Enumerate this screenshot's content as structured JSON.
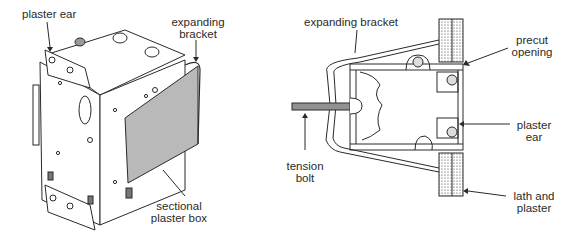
{
  "diagrams": [
    {
      "id": "left",
      "description": "Sectional plaster box with expanding bracket, perspective view",
      "labels": {
        "plaster_ear": "plaster ear",
        "expanding_bracket_1": "expanding",
        "expanding_bracket_2": "bracket",
        "sectional_box_1": "sectional",
        "sectional_box_2": "plaster box"
      }
    },
    {
      "id": "right",
      "description": "Cross-section showing box installed in precut opening of lath and plaster wall",
      "labels": {
        "expanding_bracket": "expanding bracket",
        "precut_1": "precut",
        "precut_2": "opening",
        "plaster_ear_1": "plaster",
        "plaster_ear_2": "ear",
        "tension_1": "tension",
        "tension_2": "bolt",
        "lath_1": "lath and",
        "lath_2": "plaster"
      }
    }
  ],
  "colors": {
    "line": "#2a2a2a",
    "bracket_fill": "#b9b9b9",
    "background": "#ffffff"
  }
}
